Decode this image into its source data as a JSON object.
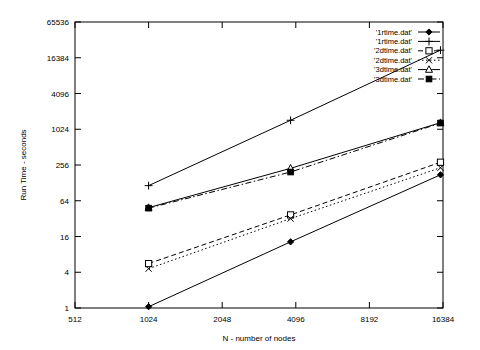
{
  "chart_data": {
    "type": "line",
    "title": "",
    "xlabel": "N - number of nodes",
    "ylabel": "Run Time - seconds",
    "xscale": "log2",
    "yscale": "log4",
    "xlim": [
      512,
      16384
    ],
    "ylim": [
      1,
      65536
    ],
    "grid": false,
    "legend_position": "top-right",
    "xticks": [
      "512",
      "1024",
      "2048",
      "4096",
      "8192",
      "16384"
    ],
    "xtick_values": [
      512,
      1024,
      2048,
      4096,
      8192,
      16384
    ],
    "yticks": [
      "1",
      "4",
      "16",
      "64",
      "256",
      "1024",
      "4096",
      "16384",
      "65536"
    ],
    "ytick_values": [
      1,
      4,
      16,
      64,
      256,
      1024,
      4096,
      16384,
      65536
    ],
    "series": [
      {
        "name": "'1rtime.dat'",
        "marker": "diamond",
        "dash": "solid",
        "x": [
          1024,
          3900,
          16000
        ],
        "values": [
          1.05,
          13,
          175
        ]
      },
      {
        "name": "'1rtime.dat'",
        "marker": "plus",
        "dash": "solid",
        "x": [
          1024,
          3900,
          16000
        ],
        "values": [
          115,
          1450,
          22000
        ]
      },
      {
        "name": "'2dtime.dat'",
        "marker": "open-square",
        "dash": "dashed",
        "x": [
          1024,
          3900,
          16000
        ],
        "values": [
          5.6,
          37,
          285
        ]
      },
      {
        "name": "'2dtime.dat'",
        "marker": "cross-x",
        "dash": "dotted",
        "x": [
          1024,
          3900,
          16000
        ],
        "values": [
          4.6,
          32,
          230
        ]
      },
      {
        "name": "'3dtime.dat'",
        "marker": "open-triangle",
        "dash": "solid",
        "x": [
          1024,
          3900,
          16000
        ],
        "values": [
          49,
          225,
          1320
        ]
      },
      {
        "name": "'3dtime.dat'",
        "marker": "filled-square",
        "dash": "dash-dot",
        "x": [
          1024,
          3900,
          16000
        ],
        "values": [
          48,
          195,
          1300
        ]
      }
    ],
    "colors": {
      "line": "#000000",
      "axis": "#000000",
      "background": "#ffffff"
    }
  }
}
